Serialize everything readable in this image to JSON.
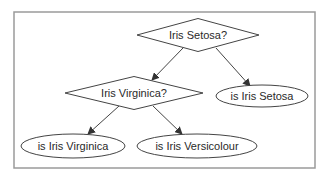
{
  "diagram": {
    "type": "decision-tree",
    "nodes": [
      {
        "id": "q_setosa",
        "shape": "diamond",
        "label": "Iris Setosa?",
        "cx": 198,
        "cy": 35,
        "w": 122,
        "h": 33
      },
      {
        "id": "q_virginica",
        "shape": "diamond",
        "label": "Iris Virginica?",
        "cx": 134,
        "cy": 93,
        "w": 138,
        "h": 33
      },
      {
        "id": "leaf_setosa",
        "shape": "ellipse",
        "label": "is Iris Setosa",
        "cx": 262,
        "cy": 96,
        "rx": 46,
        "ry": 11
      },
      {
        "id": "leaf_virginica",
        "shape": "ellipse",
        "label": "is Iris Virginica",
        "cx": 73,
        "cy": 146,
        "rx": 52,
        "ry": 12
      },
      {
        "id": "leaf_versicolour",
        "shape": "ellipse",
        "label": "is Iris Versicolour",
        "cx": 197,
        "cy": 146,
        "rx": 60,
        "ry": 12
      }
    ],
    "edges": [
      {
        "from": "q_setosa",
        "to": "q_virginica",
        "x1": 183,
        "y1": 48,
        "x2": 152,
        "y2": 80
      },
      {
        "from": "q_setosa",
        "to": "leaf_setosa",
        "x1": 216,
        "y1": 48,
        "x2": 250,
        "y2": 86
      },
      {
        "from": "q_virginica",
        "to": "leaf_virginica",
        "x1": 119,
        "y1": 106,
        "x2": 88,
        "y2": 134
      },
      {
        "from": "q_virginica",
        "to": "leaf_versicolour",
        "x1": 153,
        "y1": 106,
        "x2": 182,
        "y2": 134
      }
    ],
    "colors": {
      "stroke": "#444444",
      "frame": "#9a9a9a",
      "text": "#2a2a2a",
      "background": "#ffffff"
    }
  }
}
